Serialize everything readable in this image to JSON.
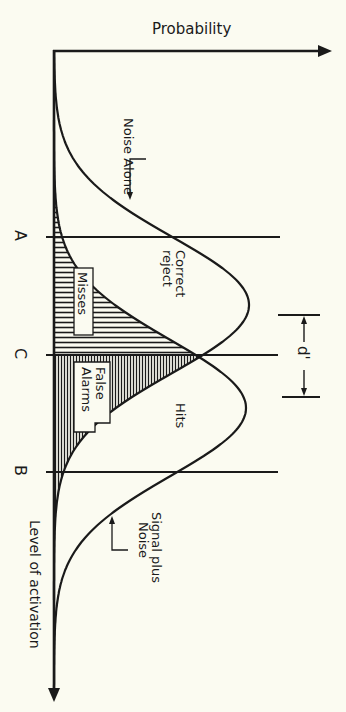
{
  "diagram": {
    "axes": {
      "y_axis_label": "Probability",
      "x_axis_label": "Level of activation"
    },
    "criteria": [
      {
        "id": "A",
        "label": "A"
      },
      {
        "id": "C",
        "label": "C"
      },
      {
        "id": "B",
        "label": "B"
      }
    ],
    "distributions": {
      "noise": {
        "label": "Noise Alone"
      },
      "signal": {
        "label_line1": "Signal plus",
        "label_line2": "Noise"
      }
    },
    "regions": {
      "correct_reject_line1": "Correct",
      "correct_reject_line2": "reject",
      "misses": "Misses",
      "false_alarms_line1": "False",
      "false_alarms_line2": "Alarms",
      "hits": "Hits"
    },
    "sensitivity": {
      "label": "d'"
    },
    "colors": {
      "ink": "#1a1a1a",
      "paper": "#fbfbf1"
    }
  }
}
